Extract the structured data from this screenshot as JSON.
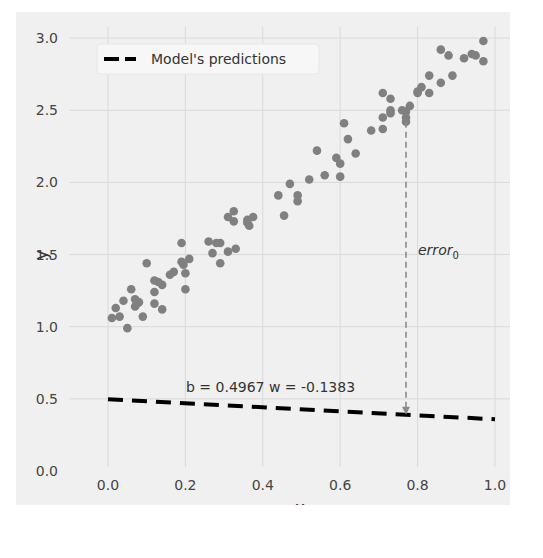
{
  "chart_data": {
    "type": "scatter",
    "title": "",
    "xlabel": "x",
    "ylabel": "y",
    "xlim": [
      0.0,
      1.0
    ],
    "ylim": [
      0.0,
      3.0
    ],
    "grid": true,
    "xticks": [
      "0.0",
      "0.2",
      "0.4",
      "0.6",
      "0.8",
      "1.0"
    ],
    "yticks": [
      "0.0",
      "0.5",
      "1.0",
      "1.5",
      "2.0",
      "2.5",
      "3.0"
    ],
    "legend": {
      "position": "upper left",
      "entries": [
        "Model's predictions"
      ]
    },
    "series": [
      {
        "name": "data",
        "kind": "scatter",
        "color": "#808080",
        "points": [
          [
            0.01,
            1.06
          ],
          [
            0.03,
            1.07
          ],
          [
            0.02,
            1.13
          ],
          [
            0.04,
            1.18
          ],
          [
            0.05,
            0.99
          ],
          [
            0.06,
            1.26
          ],
          [
            0.07,
            1.19
          ],
          [
            0.075,
            1.16
          ],
          [
            0.07,
            1.14
          ],
          [
            0.08,
            1.17
          ],
          [
            0.09,
            1.07
          ],
          [
            0.1,
            1.44
          ],
          [
            0.12,
            1.32
          ],
          [
            0.12,
            1.24
          ],
          [
            0.12,
            1.16
          ],
          [
            0.13,
            1.31
          ],
          [
            0.14,
            1.29
          ],
          [
            0.14,
            1.12
          ],
          [
            0.16,
            1.36
          ],
          [
            0.17,
            1.38
          ],
          [
            0.19,
            1.58
          ],
          [
            0.19,
            1.45
          ],
          [
            0.195,
            1.43
          ],
          [
            0.2,
            1.26
          ],
          [
            0.2,
            1.37
          ],
          [
            0.21,
            1.47
          ],
          [
            0.26,
            1.59
          ],
          [
            0.28,
            1.58
          ],
          [
            0.29,
            1.58
          ],
          [
            0.27,
            1.51
          ],
          [
            0.29,
            1.44
          ],
          [
            0.31,
            1.52
          ],
          [
            0.33,
            1.54
          ],
          [
            0.31,
            1.76
          ],
          [
            0.325,
            1.8
          ],
          [
            0.325,
            1.73
          ],
          [
            0.36,
            1.74
          ],
          [
            0.365,
            1.7
          ],
          [
            0.375,
            1.76
          ],
          [
            0.36,
            1.72
          ],
          [
            0.44,
            1.91
          ],
          [
            0.455,
            1.77
          ],
          [
            0.47,
            1.99
          ],
          [
            0.49,
            1.91
          ],
          [
            0.49,
            1.87
          ],
          [
            0.52,
            2.02
          ],
          [
            0.54,
            2.22
          ],
          [
            0.56,
            2.05
          ],
          [
            0.59,
            2.17
          ],
          [
            0.6,
            2.13
          ],
          [
            0.6,
            2.04
          ],
          [
            0.61,
            2.41
          ],
          [
            0.62,
            2.3
          ],
          [
            0.64,
            2.2
          ],
          [
            0.68,
            2.36
          ],
          [
            0.71,
            2.37
          ],
          [
            0.71,
            2.45
          ],
          [
            0.71,
            2.62
          ],
          [
            0.73,
            2.58
          ],
          [
            0.73,
            2.5
          ],
          [
            0.73,
            2.48
          ],
          [
            0.76,
            2.5
          ],
          [
            0.77,
            2.49
          ],
          [
            0.77,
            2.45
          ],
          [
            0.77,
            2.42
          ],
          [
            0.78,
            2.53
          ],
          [
            0.8,
            2.63
          ],
          [
            0.81,
            2.66
          ],
          [
            0.8,
            2.62
          ],
          [
            0.83,
            2.74
          ],
          [
            0.83,
            2.62
          ],
          [
            0.86,
            2.92
          ],
          [
            0.86,
            2.69
          ],
          [
            0.88,
            2.88
          ],
          [
            0.89,
            2.74
          ],
          [
            0.92,
            2.86
          ],
          [
            0.94,
            2.89
          ],
          [
            0.95,
            2.88
          ],
          [
            0.97,
            2.98
          ],
          [
            0.97,
            2.84
          ]
        ]
      },
      {
        "name": "Model's predictions",
        "kind": "line",
        "style": "dashed",
        "color": "#000000",
        "b": 0.4967,
        "w": -0.1383,
        "x": [
          0.0,
          1.0
        ],
        "y": [
          0.4967,
          0.3584
        ]
      }
    ],
    "annotations": [
      {
        "text": "b = 0.4967 w = -0.1383",
        "x": 0.4,
        "y": 0.53
      },
      {
        "text": "error",
        "subscript": "0",
        "x": 0.8,
        "y": 1.5,
        "arrow": {
          "x": 0.77,
          "y_from": 2.42,
          "y_to": 0.39,
          "style": "dashed",
          "color": "#888888"
        }
      }
    ]
  },
  "labels": {
    "x_axis": "x",
    "y_axis": "y",
    "legend_item": "Model's predictions",
    "params": "b = 0.4967 w = -0.1383",
    "error_main": "error",
    "error_sub": "0"
  },
  "colors": {
    "background": "#f0f0f0",
    "grid": "#d9d9d9",
    "points": "#808080",
    "prediction_line": "#000000",
    "error_arrow": "#8a8a8a"
  }
}
